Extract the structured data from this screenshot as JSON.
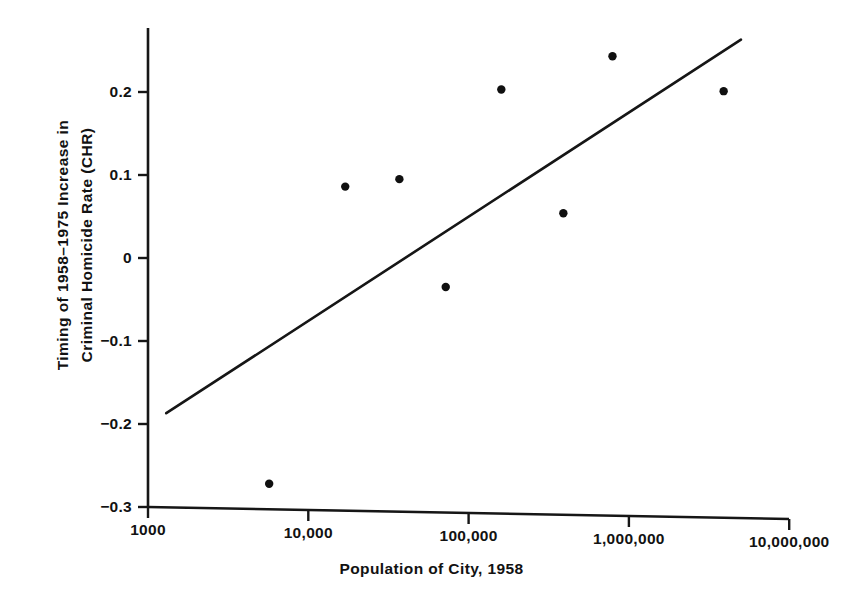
{
  "chart_data": {
    "type": "scatter",
    "title": "",
    "xlabel": "Population of City, 1958",
    "ylabel_line1": "Timing of 1958–1975 Increase in",
    "ylabel_line2": "Criminal Homicide Rate (CHR)",
    "ylabel": "Timing of 1958–1975 Increase in Criminal Homicide Rate (CHR)",
    "xscale": "log",
    "yscale": "linear",
    "xlim": [
      1000,
      10000000
    ],
    "ylim": [
      -0.3,
      0.26
    ],
    "grid": false,
    "legend": null,
    "xticks": [
      1000,
      10000,
      100000,
      1000000,
      10000000
    ],
    "xtick_labels": [
      "1000",
      "10,000",
      "100,000",
      "1,000,000",
      "10,000,000"
    ],
    "yticks": [
      0.2,
      0.1,
      0,
      -0.1,
      -0.2,
      -0.3
    ],
    "ytick_labels": [
      "0.2",
      "0.1",
      "0",
      "−0.1",
      "−0.2",
      "−0.3"
    ],
    "points": [
      {
        "x": 5700,
        "y": -0.272
      },
      {
        "x": 17000,
        "y": 0.086
      },
      {
        "x": 37000,
        "y": 0.095
      },
      {
        "x": 72000,
        "y": -0.035
      },
      {
        "x": 160000,
        "y": 0.203
      },
      {
        "x": 390000,
        "y": 0.054
      },
      {
        "x": 790000,
        "y": 0.243
      },
      {
        "x": 3900000,
        "y": 0.201
      }
    ],
    "fit_line": {
      "type": "linear-regression",
      "x_start": 1300,
      "y_start": -0.187,
      "x_end": 5000000,
      "y_end": 0.263
    },
    "marker": "filled-circle",
    "marker_color": "#101010",
    "line_color": "#161616",
    "background_color": "#ffffff"
  }
}
